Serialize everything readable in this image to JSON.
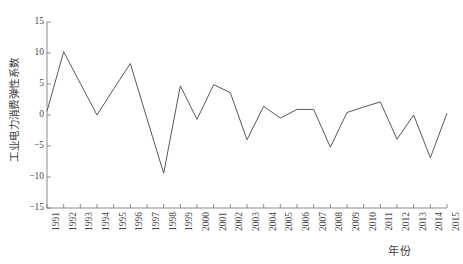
{
  "chart_data": {
    "type": "line",
    "title": "",
    "xlabel": "年份",
    "ylabel": "工业电力消费弹性系数",
    "categories": [
      "1991",
      "1992",
      "1993",
      "1994",
      "1995",
      "1996",
      "1997",
      "1998",
      "1999",
      "2000",
      "2001",
      "2002",
      "2003",
      "2004",
      "2005",
      "2006",
      "2007",
      "2008",
      "2009",
      "2010",
      "2011",
      "2012",
      "2013",
      "2014",
      "2015"
    ],
    "values": [
      0.6,
      10.2,
      5.1,
      0.0,
      4.2,
      8.3,
      -0.6,
      -9.4,
      4.7,
      -0.7,
      4.9,
      3.6,
      -4.0,
      1.4,
      -0.5,
      0.9,
      0.9,
      -5.2,
      0.4,
      1.3,
      2.1,
      -3.9,
      0.0,
      -6.9,
      0.3
    ],
    "series": [
      {
        "name": "工业电力消费弹性系数",
        "values": [
          0.6,
          10.2,
          5.1,
          0.0,
          4.2,
          8.3,
          -0.6,
          -9.4,
          4.7,
          -0.7,
          4.9,
          3.6,
          -4.0,
          1.4,
          -0.5,
          0.9,
          0.9,
          -5.2,
          0.4,
          1.3,
          2.1,
          -3.9,
          0.0,
          -6.9,
          0.3
        ]
      }
    ],
    "ylim": [
      -15,
      15
    ],
    "yticks": [
      15,
      10,
      5,
      0,
      -5,
      -10,
      -15
    ],
    "ytick_labels": [
      "15",
      "10",
      "5",
      "0",
      "−5",
      "−10",
      "−15"
    ],
    "xlim": [
      1991,
      2015
    ],
    "grid": false,
    "legend": false,
    "legend_position": "none",
    "line_color": "#595959",
    "axis_color": "#808080",
    "background_color": "#ffffff"
  }
}
